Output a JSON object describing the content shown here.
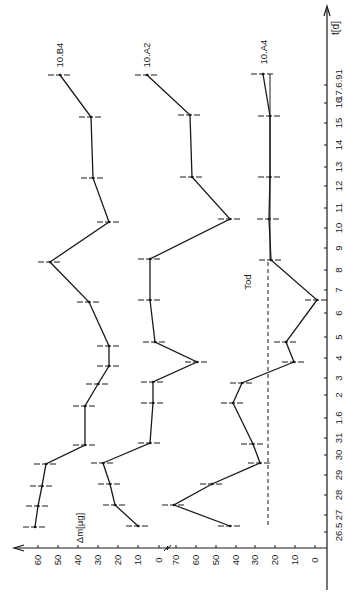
{
  "chart_data": {
    "type": "line",
    "orientation": "rotated-90-ccw",
    "title": "",
    "xlabel": "t[d]",
    "ylabel": "Δm[µg]",
    "x": [
      "26.5",
      "27",
      "28",
      "29",
      "30",
      "31",
      "1.6",
      "2",
      "3",
      "4",
      "5",
      "6",
      "7",
      "8",
      "9",
      "10",
      "11",
      "12",
      "13",
      "14",
      "15",
      "16",
      "17.6.91"
    ],
    "x_tick_px": [
      532,
      515,
      495,
      475,
      455,
      438,
      418,
      395,
      378,
      358,
      337,
      313,
      290,
      270,
      248,
      228,
      208,
      186,
      167,
      145,
      123,
      103,
      85
    ],
    "y_scales": [
      {
        "name": "left",
        "ticks": [
          60,
          50,
          40,
          30,
          20,
          10,
          0
        ],
        "tick_px": [
          38,
          58,
          78,
          98,
          118,
          138,
          159
        ],
        "label": "Δm[µg]"
      },
      {
        "name": "right",
        "ticks": [
          70,
          60,
          50,
          40,
          30,
          20,
          10,
          0
        ],
        "tick_px": [
          176,
          196,
          216,
          236,
          255,
          275,
          295,
          315
        ]
      }
    ],
    "axis_break_label": "≈",
    "series": [
      {
        "name": "10.B4",
        "scale": "left",
        "x": [
          "26.5",
          "27",
          "28",
          "29",
          "30",
          "1.6",
          "2",
          "3",
          "4",
          "6",
          "8",
          "10",
          "12",
          "15",
          "17.6.91"
        ],
        "values": [
          61,
          60,
          58,
          56,
          37,
          37,
          30,
          25,
          25,
          35,
          54,
          25,
          33,
          34,
          49
        ],
        "px": [
          [
            35,
            527
          ],
          [
            38,
            506
          ],
          [
            42,
            486
          ],
          [
            46,
            464
          ],
          [
            85,
            445
          ],
          [
            85,
            406
          ],
          [
            98,
            384
          ],
          [
            109,
            366
          ],
          [
            109,
            346
          ],
          [
            89,
            302
          ],
          [
            50,
            262
          ],
          [
            109,
            222
          ],
          [
            93,
            178
          ],
          [
            91,
            117
          ],
          [
            60,
            75
          ]
        ]
      },
      {
        "name": "10.A2",
        "scale": "right (offset)",
        "x": [
          "26.5",
          "27",
          "28",
          "29",
          "30",
          "1.6",
          "2",
          "3",
          "4",
          "6",
          "8",
          "10",
          "12",
          "15",
          "17.6.91"
        ],
        "values": [
          89,
          100,
          103,
          106,
          83,
          81,
          81,
          59,
          80,
          83,
          83,
          43,
          62,
          63,
          84
        ],
        "px": [
          [
            138,
            526
          ],
          [
            115,
            505
          ],
          [
            110,
            484
          ],
          [
            103,
            463
          ],
          [
            150,
            443
          ],
          [
            153,
            403
          ],
          [
            153,
            382
          ],
          [
            197,
            362
          ],
          [
            155,
            342
          ],
          [
            150,
            300
          ],
          [
            150,
            259
          ],
          [
            230,
            219
          ],
          [
            192,
            177
          ],
          [
            190,
            115
          ],
          [
            147,
            75
          ]
        ]
      },
      {
        "name": "10.A4",
        "scale": "right",
        "x": [
          "26.5",
          "27",
          "28",
          "29",
          "30",
          "1.6",
          "2",
          "3",
          "4",
          "6",
          "8",
          "10",
          "12",
          "15",
          "17.6.91"
        ],
        "values": [
          43,
          71,
          52,
          28,
          31,
          41,
          37,
          11,
          15,
          0,
          22,
          23,
          23,
          23,
          26
        ],
        "px": [
          [
            230,
            526
          ],
          [
            174,
            505
          ],
          [
            212,
            484
          ],
          [
            260,
            463
          ],
          [
            253,
            444
          ],
          [
            233,
            403
          ],
          [
            242,
            383
          ],
          [
            294,
            362
          ],
          [
            286,
            342
          ],
          [
            317,
            300
          ],
          [
            271,
            260
          ],
          [
            269,
            219
          ],
          [
            270,
            177
          ],
          [
            270,
            116
          ],
          [
            263,
            74
          ]
        ]
      }
    ],
    "annotations": [
      {
        "text": "Tod",
        "px": [
          248,
          282
        ],
        "rotation": -90
      },
      {
        "text": "10.B4",
        "px": [
          60,
          55
        ],
        "rotation": -90
      },
      {
        "text": "10.A2",
        "px": [
          147,
          55
        ],
        "rotation": -90
      },
      {
        "text": "10.A4",
        "px": [
          264,
          52
        ],
        "rotation": -90
      }
    ],
    "reference_lines": [
      {
        "type": "dashed",
        "value": 24,
        "scale": "right",
        "x_px": 268,
        "from_y": 262,
        "to_y": 525
      },
      {
        "type": "solid",
        "x_px": 270,
        "from_y": 74,
        "to_y": 260
      }
    ],
    "grid": false,
    "legend": "inline labels"
  }
}
